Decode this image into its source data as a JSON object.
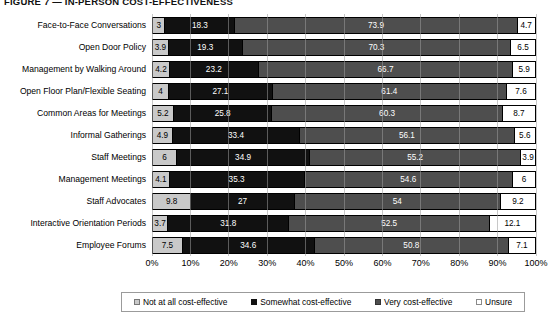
{
  "figure": {
    "title": "FIGURE 7 — IN-PERSON COST-EFFECTIVENESS"
  },
  "legend": {
    "items": [
      {
        "label": "Not at all cost-effective",
        "swatch": "sw-notatall",
        "icon": "square-swatch-icon"
      },
      {
        "label": "Somewhat cost-effective",
        "swatch": "sw-somewhat",
        "icon": "square-swatch-icon"
      },
      {
        "label": "Very cost-effective",
        "swatch": "sw-very",
        "icon": "square-swatch-icon"
      },
      {
        "label": "Unsure",
        "swatch": "sw-unsure",
        "icon": "square-swatch-icon"
      }
    ]
  },
  "axis": {
    "ticks": [
      "0%",
      "10%",
      "20%",
      "30%",
      "40%",
      "50%",
      "60%",
      "70%",
      "80%",
      "90%",
      "100%"
    ]
  },
  "colors": {
    "not_at_all": "#c9c9c9",
    "somewhat": "#111111",
    "very": "#4e4e4e",
    "unsure": "#ffffff",
    "gridline": "#9a9a9a",
    "border": "#000000"
  },
  "chart_data": {
    "type": "bar",
    "orientation": "horizontal",
    "stacked": true,
    "stacked_percent": true,
    "title": "FIGURE 7 — IN-PERSON COST-EFFECTIVENESS",
    "xlabel": "",
    "ylabel": "",
    "xlim": [
      0,
      100
    ],
    "xticks": [
      0,
      10,
      20,
      30,
      40,
      50,
      60,
      70,
      80,
      90,
      100
    ],
    "xtick_labels": [
      "0%",
      "10%",
      "20%",
      "30%",
      "40%",
      "50%",
      "60%",
      "70%",
      "80%",
      "90%",
      "100%"
    ],
    "grid": true,
    "legend_position": "bottom",
    "categories": [
      "Face-to-Face Conversations",
      "Open Door Policy",
      "Management by Walking Around",
      "Open Floor Plan/Flexible Seating",
      "Common Areas for Meetings",
      "Informal Gatherings",
      "Staff Meetings",
      "Management Meetings",
      "Staff Advocates",
      "Interactive Orientation Periods",
      "Employee Forums"
    ],
    "series": [
      {
        "name": "Not at all cost-effective",
        "values": [
          3,
          3.9,
          4.2,
          4,
          5.2,
          4.9,
          6,
          4.1,
          9.8,
          3.7,
          7.5
        ]
      },
      {
        "name": "Somewhat cost-effective",
        "values": [
          18.3,
          19.3,
          23.2,
          27.1,
          25.8,
          33.4,
          34.9,
          35.3,
          27,
          31.8,
          34.6
        ]
      },
      {
        "name": "Very cost-effective",
        "values": [
          73.9,
          70.3,
          66.7,
          61.4,
          60.3,
          56.1,
          55.2,
          54.6,
          54,
          52.5,
          50.8
        ]
      },
      {
        "name": "Unsure",
        "values": [
          4.7,
          6.5,
          5.9,
          7.6,
          8.7,
          5.6,
          3.9,
          6,
          9.2,
          12.1,
          7.1
        ]
      }
    ]
  }
}
